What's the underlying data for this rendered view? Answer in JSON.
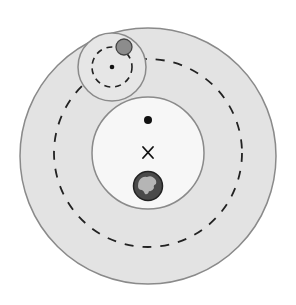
{
  "diagram": {
    "colors": {
      "outer_region_fill": "#e3e3e3",
      "inner_region_fill": "#f7f7f7",
      "outline": "#8a8a8a",
      "dashed_orbit": "#222222",
      "moon_fill": "#8c8c8c",
      "earth_ocean": "#4a4a4a",
      "earth_land": "#b5b5b5",
      "marker": "#111111"
    },
    "elements": [
      {
        "id": "outer-region",
        "label": "outer circle"
      },
      {
        "id": "large-dashed-orbit",
        "label": "large dashed orbit"
      },
      {
        "id": "inner-region",
        "label": "inner circle"
      },
      {
        "id": "small-region",
        "label": "small circle around moon orbit center"
      },
      {
        "id": "small-dashed-orbit",
        "label": "small dashed orbit"
      },
      {
        "id": "moon",
        "label": "gray body"
      },
      {
        "id": "earth",
        "label": "earth"
      },
      {
        "id": "center-dot",
        "label": "dot"
      },
      {
        "id": "barycenter-marker",
        "label": "x"
      }
    ],
    "marker_glyph": "×"
  }
}
